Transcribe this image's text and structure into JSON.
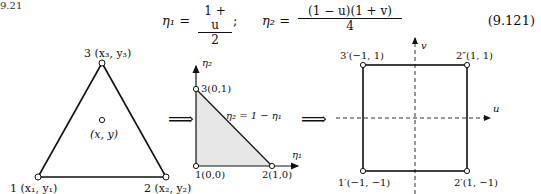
{
  "section_fragment": "9.21",
  "equation": {
    "lhs1": "η₁ =",
    "frac1": {
      "numerator": "1 + u",
      "denominator": "2"
    },
    "separator": ";",
    "lhs2": "η₂ =",
    "frac2": {
      "numerator": "(1 − u)(1 + v)",
      "denominator": "4"
    },
    "number": "(9.121)"
  },
  "figure": {
    "arrow_symbol": "⟹",
    "triangle": {
      "vertices": [
        {
          "label": "1 (x₁, y₁)"
        },
        {
          "label": "2 (x₂, y₂)"
        },
        {
          "label": "3 (x₃, y₃)"
        }
      ],
      "interior_point": "(x, y)"
    },
    "reference_triangle": {
      "x_axis": "η₁",
      "y_axis": "η₂",
      "vertices": [
        {
          "label": "1(0,0)"
        },
        {
          "label": "2(1,0)"
        },
        {
          "label": "3(0,1)"
        }
      ],
      "edge_label": "η₂ = 1 − η₁",
      "fill_color": "#e6e6e6"
    },
    "square": {
      "x_axis": "u",
      "y_axis": "v",
      "vertices": [
        {
          "label": "1′(−1, −1)"
        },
        {
          "label": "2′(1, −1)"
        },
        {
          "label": "2″(1, 1)"
        },
        {
          "label": "3′(−1, 1)"
        }
      ]
    }
  }
}
